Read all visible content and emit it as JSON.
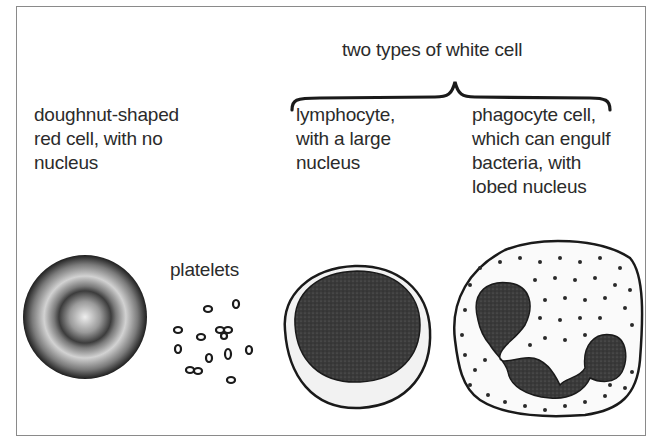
{
  "diagram": {
    "header": "two types of white cell",
    "labels": {
      "red_cell": "doughnut-shaped\nred cell, with no\nnucleus",
      "platelets": "platelets",
      "lymphocyte": "lymphocyte,\nwith a large\nnucleus",
      "phagocyte": "phagocyte cell,\nwhich can engulf\nbacteria, with\nlobed nucleus"
    },
    "colors": {
      "border": "#8a8a8a",
      "ink": "#1a1a1a",
      "nucleus": "#3a3a3a",
      "cytoplasm": "#f4f4f4"
    }
  }
}
